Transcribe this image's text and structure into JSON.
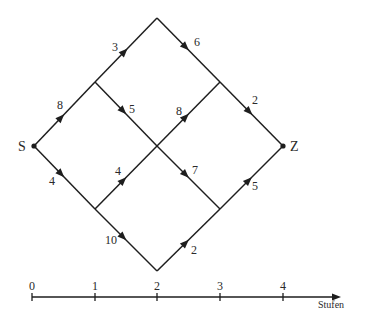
{
  "colors": {
    "stroke": "#1e1e1e",
    "text": "#2a2a2a",
    "background": "#ffffff"
  },
  "nodes": [
    {
      "id": "S",
      "label": "S",
      "x": 34,
      "y": 146,
      "stage": 0,
      "dot": true,
      "lx": 18,
      "ly": 151
    },
    {
      "id": "U1",
      "label": "",
      "x": 95,
      "y": 82,
      "stage": 1,
      "dot": false
    },
    {
      "id": "L1",
      "label": "",
      "x": 95,
      "y": 209,
      "stage": 1,
      "dot": false
    },
    {
      "id": "T",
      "label": "",
      "x": 157,
      "y": 18,
      "stage": 2,
      "dot": false
    },
    {
      "id": "C",
      "label": "",
      "x": 157,
      "y": 146,
      "stage": 2,
      "dot": false
    },
    {
      "id": "B",
      "label": "",
      "x": 157,
      "y": 271,
      "stage": 2,
      "dot": false
    },
    {
      "id": "U3",
      "label": "",
      "x": 220,
      "y": 82,
      "stage": 3,
      "dot": false
    },
    {
      "id": "L3",
      "label": "",
      "x": 220,
      "y": 209,
      "stage": 3,
      "dot": false
    },
    {
      "id": "Z",
      "label": "Z",
      "x": 283,
      "y": 146,
      "stage": 4,
      "dot": true,
      "lx": 290,
      "ly": 151
    }
  ],
  "edges": [
    {
      "from": "S",
      "to": "U1",
      "weight": "8",
      "t": 0.45,
      "lx": 57,
      "ly": 109
    },
    {
      "from": "S",
      "to": "L1",
      "weight": "4",
      "t": 0.45,
      "lx": 49,
      "ly": 185
    },
    {
      "from": "U1",
      "to": "T",
      "weight": "3",
      "t": 0.48,
      "lx": 112,
      "ly": 51
    },
    {
      "from": "U1",
      "to": "C",
      "weight": "5",
      "t": 0.46,
      "lx": 129,
      "ly": 113
    },
    {
      "from": "L1",
      "to": "C",
      "weight": "4",
      "t": 0.46,
      "lx": 115,
      "ly": 175
    },
    {
      "from": "L1",
      "to": "B",
      "weight": "10",
      "t": 0.46,
      "lx": 105,
      "ly": 244
    },
    {
      "from": "T",
      "to": "U3",
      "weight": "6",
      "t": 0.46,
      "lx": 194,
      "ly": 46
    },
    {
      "from": "C",
      "to": "U3",
      "weight": "8",
      "t": 0.46,
      "lx": 176,
      "ly": 115
    },
    {
      "from": "C",
      "to": "L3",
      "weight": "7",
      "t": 0.46,
      "lx": 192,
      "ly": 174
    },
    {
      "from": "B",
      "to": "L3",
      "weight": "2",
      "t": 0.46,
      "lx": 191,
      "ly": 254
    },
    {
      "from": "U3",
      "to": "Z",
      "weight": "2",
      "t": 0.47,
      "lx": 252,
      "ly": 104
    },
    {
      "from": "L3",
      "to": "Z",
      "weight": "5",
      "t": 0.46,
      "lx": 252,
      "ly": 190
    }
  ],
  "axis": {
    "y": 297,
    "x_start": 32,
    "x_end": 341,
    "label": "Stufen",
    "label_x": 318,
    "label_y": 308,
    "ticks": [
      {
        "value": "0",
        "x": 32
      },
      {
        "value": "1",
        "x": 95
      },
      {
        "value": "2",
        "x": 157
      },
      {
        "value": "3",
        "x": 220
      },
      {
        "value": "4",
        "x": 283
      }
    ]
  }
}
